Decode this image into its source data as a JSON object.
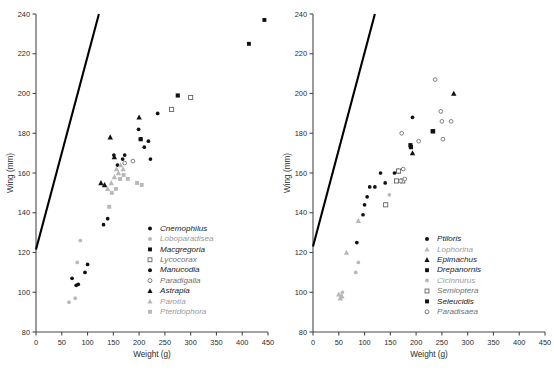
{
  "figure": {
    "title": "",
    "panels": [
      "left",
      "right"
    ]
  },
  "axes": {
    "xlabel": "Weight (g)",
    "ylabel": "Wing (mm)",
    "xlim": [
      0,
      450
    ],
    "ylim": [
      80,
      240
    ],
    "xticks": [
      0,
      50,
      100,
      150,
      200,
      250,
      300,
      350,
      400,
      450
    ],
    "yticks": [
      80,
      100,
      120,
      140,
      160,
      180,
      200,
      220,
      240
    ],
    "xticklabels": [
      "0",
      "50",
      "100",
      "150",
      "200",
      "250",
      "300",
      "350",
      "400",
      "450"
    ],
    "yticklabels": [
      "80",
      "100",
      "120",
      "140",
      "160",
      "180",
      "200",
      "220",
      "240"
    ],
    "grid": false
  },
  "colors": {
    "axis": "#4a4a4a",
    "text": "#2b2b2b",
    "filled": "#111111",
    "open": "#555555",
    "faint": "#b0b0b0",
    "refline": "#000000"
  },
  "chart_data": [
    {
      "type": "scatter",
      "panel": "left",
      "title": "",
      "xlabel": "Weight (g)",
      "ylabel": "Wing (mm)",
      "xlim": [
        0,
        450
      ],
      "ylim": [
        80,
        240
      ],
      "grid": false,
      "legend_position": "lower-right",
      "reference_line": {
        "name": "isometry-line",
        "points": [
          [
            0,
            121.5
          ],
          [
            122,
            240
          ]
        ]
      },
      "series": [
        {
          "name": "Cnemophilus",
          "marker": "filled-circle",
          "color": "#111111",
          "size": 3.0,
          "points": [
            [
              70,
              107
            ],
            [
              78,
              103.5
            ],
            [
              82,
              104
            ],
            [
              95,
              110
            ],
            [
              100,
              114
            ]
          ]
        },
        {
          "name": "Loboparadisea",
          "marker": "faint-circle",
          "color": "#b8b8b8",
          "size": 3.0,
          "points": [
            [
              64,
              95
            ],
            [
              76,
              97
            ],
            [
              80,
              115
            ],
            [
              86,
              126
            ]
          ]
        },
        {
          "name": "Macgregoria",
          "marker": "filled-square",
          "color": "#111111",
          "size": 3.4,
          "points": [
            [
              203,
              177
            ],
            [
              275,
              199
            ]
          ]
        },
        {
          "name": "Lycocorax",
          "marker": "open-square",
          "color": "#5a5a5a",
          "size": 3.4,
          "points": [
            [
              263,
              192
            ],
            [
              300,
              198
            ]
          ]
        },
        {
          "name": "Manucodia",
          "marker": "filled-circle",
          "color": "#111111",
          "size": 3.0,
          "points": [
            [
              131,
              134
            ],
            [
              139,
              137
            ],
            [
              151,
              169
            ],
            [
              158,
              164
            ],
            [
              168,
              167
            ],
            [
              172,
              169
            ],
            [
              199,
              182
            ],
            [
              203,
              177
            ],
            [
              210,
              173
            ],
            [
              218,
              176
            ],
            [
              222,
              167
            ],
            [
              236,
              190
            ]
          ]
        },
        {
          "name": "Paradigalla",
          "marker": "open-circle",
          "color": "#6a6a6a",
          "size": 3.0,
          "points": [
            [
              172,
              165
            ],
            [
              188,
              166
            ]
          ]
        },
        {
          "name": "Astrapia",
          "marker": "filled-triangle",
          "color": "#111111",
          "size": 3.4,
          "points": [
            [
              126,
              155
            ],
            [
              133,
              154
            ],
            [
              144,
              178
            ],
            [
              152,
              168
            ],
            [
              200,
              188
            ]
          ]
        },
        {
          "name": "Parotia",
          "marker": "faint-triangle",
          "color": "#b8b8b8",
          "size": 3.4,
          "points": [
            [
              139,
              152
            ],
            [
              146,
              155
            ],
            [
              152,
              158
            ],
            [
              156,
              162
            ],
            [
              160,
              160
            ],
            [
              164,
              164
            ],
            [
              169,
              162
            ]
          ]
        },
        {
          "name": "Pteridophora",
          "marker": "faint-square",
          "color": "#b8b8b8",
          "size": 3.2,
          "points": [
            [
              142,
              143
            ],
            [
              147,
              150
            ],
            [
              155,
              152
            ],
            [
              163,
              157
            ],
            [
              170,
              159
            ],
            [
              178,
              157
            ],
            [
              196,
              155
            ],
            [
              205,
              154
            ]
          ]
        },
        {
          "name": "Outliers",
          "marker": "filled-square",
          "color": "#111111",
          "size": 3.2,
          "points": [
            [
              413,
              225
            ],
            [
              443,
              237
            ]
          ]
        }
      ],
      "legend": [
        {
          "label": "Cnemophilus",
          "marker": "filled-circle",
          "color": "#111111"
        },
        {
          "label": "Loboparadisea",
          "marker": "faint-circle",
          "color": "#b8b8b8"
        },
        {
          "label": "Macgregoria",
          "marker": "filled-square",
          "color": "#111111"
        },
        {
          "label": "Lycocorax",
          "marker": "open-square",
          "color": "#5a5a5a"
        },
        {
          "label": "Manucodia",
          "marker": "filled-circle",
          "color": "#111111"
        },
        {
          "label": "Paradigalla",
          "marker": "open-circle",
          "color": "#6a6a6a"
        },
        {
          "label": "Astrapia",
          "marker": "filled-triangle",
          "color": "#111111"
        },
        {
          "label": "Parotia",
          "marker": "faint-triangle",
          "color": "#b8b8b8"
        },
        {
          "label": "Pteridophora",
          "marker": "faint-square",
          "color": "#b8b8b8"
        }
      ]
    },
    {
      "type": "scatter",
      "panel": "right",
      "title": "",
      "xlabel": "Weight (g)",
      "ylabel": "Wing (mm)",
      "xlim": [
        0,
        450
      ],
      "ylim": [
        80,
        240
      ],
      "grid": false,
      "legend_position": "lower-right",
      "reference_line": {
        "name": "isometry-line",
        "points": [
          [
            0,
            123
          ],
          [
            120,
            240
          ]
        ]
      },
      "series": [
        {
          "name": "Ptiloris",
          "marker": "filled-circle",
          "color": "#111111",
          "size": 3.0,
          "points": [
            [
              85,
              125
            ],
            [
              97,
              139
            ],
            [
              100,
              144
            ],
            [
              105,
              148
            ],
            [
              110,
              153
            ],
            [
              120,
              153
            ],
            [
              131,
              160
            ],
            [
              140,
              155
            ],
            [
              158,
              160
            ],
            [
              193,
              188
            ]
          ]
        },
        {
          "name": "Lophorina",
          "marker": "faint-triangle",
          "color": "#b8b8b8",
          "size": 3.4,
          "points": [
            [
              50,
              99
            ],
            [
              53,
              97
            ],
            [
              56,
              98
            ],
            [
              65,
              120
            ],
            [
              88,
              136
            ]
          ]
        },
        {
          "name": "Epimachus",
          "marker": "filled-triangle",
          "color": "#111111",
          "size": 3.4,
          "points": [
            [
              165,
              161
            ],
            [
              193,
              170
            ],
            [
              273,
              200
            ]
          ]
        },
        {
          "name": "Drepanornis",
          "marker": "filled-square",
          "color": "#111111",
          "size": 3.4,
          "points": [
            [
              190,
              173
            ],
            [
              232,
              181
            ]
          ]
        },
        {
          "name": "Cicinnurus",
          "marker": "faint-circle",
          "color": "#b8b8b8",
          "size": 3.0,
          "points": [
            [
              54,
              98
            ],
            [
              57,
              100
            ],
            [
              83,
              110
            ],
            [
              88,
              115
            ],
            [
              148,
              149
            ]
          ]
        },
        {
          "name": "Semioptera",
          "marker": "open-square",
          "color": "#5a5a5a",
          "size": 3.4,
          "points": [
            [
              141,
              144
            ],
            [
              162,
              156
            ],
            [
              166,
              161
            ],
            [
              174,
              156
            ]
          ]
        },
        {
          "name": "Seleucidis",
          "marker": "filled-square",
          "color": "#111111",
          "size": 3.4,
          "points": [
            [
              189,
              174
            ],
            [
              233,
              181
            ]
          ]
        },
        {
          "name": "Paradisaea",
          "marker": "open-circle",
          "color": "#6a6a6a",
          "size": 3.0,
          "points": [
            [
              170,
              156
            ],
            [
              172,
              180
            ],
            [
              175,
              162
            ],
            [
              178,
              157
            ],
            [
              205,
              176
            ],
            [
              237,
              207
            ],
            [
              248,
              191
            ],
            [
              250,
              186
            ],
            [
              252,
              177
            ],
            [
              268,
              186
            ]
          ]
        }
      ],
      "legend": [
        {
          "label": "Ptiloris",
          "marker": "filled-circle",
          "color": "#111111"
        },
        {
          "label": "Lophorina",
          "marker": "faint-triangle",
          "color": "#b8b8b8"
        },
        {
          "label": "Epimachus",
          "marker": "filled-triangle",
          "color": "#111111"
        },
        {
          "label": "Drepanornis",
          "marker": "filled-square",
          "color": "#111111"
        },
        {
          "label": "Cicinnurus",
          "marker": "faint-circle",
          "color": "#b8b8b8"
        },
        {
          "label": "Semioptera",
          "marker": "open-square",
          "color": "#5a5a5a"
        },
        {
          "label": "Seleucidis",
          "marker": "filled-square",
          "color": "#111111"
        },
        {
          "label": "Paradisaea",
          "marker": "open-circle",
          "color": "#6a6a6a"
        }
      ]
    }
  ]
}
